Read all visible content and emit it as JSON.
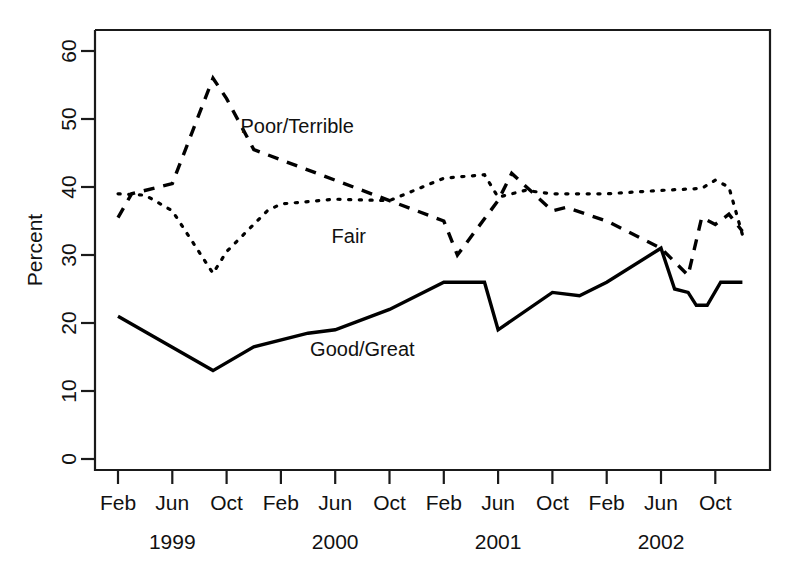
{
  "chart_data": {
    "type": "line",
    "title": "",
    "subtitle": "",
    "xlabel": "",
    "ylabel": "Percent",
    "ylim": [
      0,
      63
    ],
    "xlim": [
      0,
      48
    ],
    "grid": false,
    "legend_position": "inline-annotations",
    "y_ticks": [
      "0",
      "10",
      "20",
      "30",
      "40",
      "50",
      "60"
    ],
    "y_tick_values": [
      0,
      10,
      20,
      30,
      40,
      50,
      60
    ],
    "x_tick_labels": [
      "Feb",
      "Jun",
      "Oct",
      "Feb",
      "Jun",
      "Oct",
      "Feb",
      "Jun",
      "Oct",
      "Feb",
      "Jun",
      "Oct"
    ],
    "x_tick_months": [
      2,
      6,
      10,
      14,
      18,
      22,
      26,
      30,
      34,
      38,
      42,
      46
    ],
    "year_labels": [
      "1999",
      "2000",
      "2001",
      "2002"
    ],
    "year_label_months": [
      6,
      18,
      30,
      42
    ],
    "annotations": [
      {
        "text": "Poor/Terrible",
        "month": 15.2,
        "value": 48.0
      },
      {
        "text": "Fair",
        "month": 19.0,
        "value": 31.8
      },
      {
        "text": "Good/Great",
        "month": 20.0,
        "value": 15.2
      }
    ],
    "series": [
      {
        "name": "Poor/Terrible",
        "style": "dashed",
        "color": "#000000",
        "x": [
          2,
          3,
          6,
          9,
          10,
          12,
          14,
          18,
          22,
          26,
          27,
          30,
          31,
          34,
          35,
          38,
          42,
          44,
          45,
          46,
          47,
          48
        ],
        "values": [
          35.5,
          39.0,
          40.5,
          56.0,
          53.0,
          45.5,
          44.0,
          41.0,
          38.0,
          35.0,
          30.0,
          38.0,
          42.0,
          36.5,
          37.0,
          35.0,
          31.0,
          27.0,
          35.5,
          34.5,
          36.0,
          33.5
        ]
      },
      {
        "name": "Fair",
        "style": "dotted",
        "color": "#000000",
        "x": [
          2,
          4,
          6,
          9,
          10,
          13,
          14,
          18,
          22,
          26,
          29,
          30,
          32,
          34,
          38,
          42,
          45,
          46,
          47,
          48
        ],
        "values": [
          39.0,
          38.8,
          36.5,
          27.3,
          30.5,
          36.5,
          37.5,
          38.2,
          38.0,
          41.3,
          41.8,
          38.5,
          39.5,
          39.0,
          39.0,
          39.5,
          39.8,
          41.0,
          40.0,
          33.0
        ]
      },
      {
        "name": "Good/Great",
        "style": "solid",
        "color": "#000000",
        "x": [
          2,
          9,
          12,
          16,
          18,
          22,
          26,
          29,
          30,
          34,
          36,
          38,
          42,
          43,
          44,
          44.6,
          45.4,
          46.4,
          47,
          48
        ],
        "values": [
          21.0,
          13.0,
          16.5,
          18.5,
          19.0,
          22.0,
          26.0,
          26.0,
          19.0,
          24.5,
          24.0,
          26.0,
          31.0,
          25.0,
          24.5,
          22.6,
          22.6,
          26.0,
          26.0,
          26.0
        ]
      }
    ]
  },
  "axis": {
    "y_title": "Percent"
  }
}
